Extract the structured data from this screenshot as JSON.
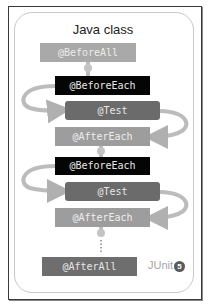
{
  "diagram": {
    "title": "Java class",
    "steps": [
      {
        "label": "@BeforeAll",
        "kind": "before-all"
      },
      {
        "label": "@BeforeEach",
        "kind": "before-each"
      },
      {
        "label": "@Test",
        "kind": "test"
      },
      {
        "label": "@AfterEach",
        "kind": "after-each"
      },
      {
        "label": "@BeforeEach",
        "kind": "before-each"
      },
      {
        "label": "@Test",
        "kind": "test"
      },
      {
        "label": "@AfterEach",
        "kind": "after-each"
      },
      {
        "label": "@AfterAll",
        "kind": "after-all"
      }
    ],
    "continuation": "⋮",
    "logo": {
      "text": "JUnit",
      "badge": "5"
    }
  },
  "colors": {
    "before_all": "#a9a9a9",
    "before_each": "#050505",
    "test": "#6b6b6b",
    "after_each": "#9d9d9d",
    "after_all": "#6e6e6e",
    "arrow": "#b5b5b5"
  }
}
